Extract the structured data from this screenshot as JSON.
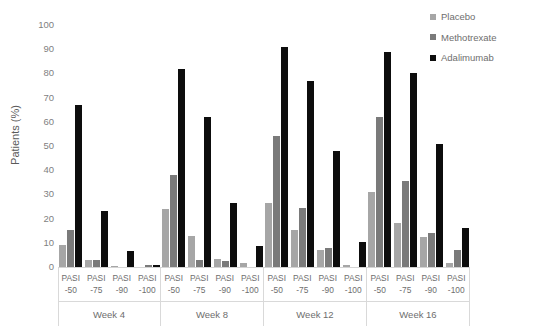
{
  "chart_data": {
    "type": "bar",
    "title": "",
    "xlabel": "",
    "ylabel": "Patients (%)",
    "ylim": [
      0,
      100
    ],
    "ytick_step": 10,
    "yticks": [
      100,
      90,
      80,
      70,
      60,
      50,
      40,
      30,
      20,
      10,
      0
    ],
    "grid": false,
    "legend_position": "top-right",
    "groups": [
      "Week 4",
      "Week 8",
      "Week 12",
      "Week 16"
    ],
    "categories": [
      "PASI -50",
      "PASI -75",
      "PASI -90",
      "PASI -100"
    ],
    "category_lines": [
      {
        "top": "PASI",
        "bottom": "-50"
      },
      {
        "top": "PASI",
        "bottom": "-75"
      },
      {
        "top": "PASI",
        "bottom": "-90"
      },
      {
        "top": "PASI",
        "bottom": "-100"
      }
    ],
    "series": [
      {
        "name": "Placebo",
        "color": "#a6a6a6"
      },
      {
        "name": "Methotrexate",
        "color": "#7a7a7a"
      },
      {
        "name": "Adalimumab",
        "color": "#0d0d0d"
      }
    ],
    "values": {
      "Week 4": {
        "PASI -50": {
          "Placebo": 9,
          "Methotrexate": 15.5,
          "Adalimumab": 67
        },
        "PASI -75": {
          "Placebo": 3,
          "Methotrexate": 3,
          "Adalimumab": 23
        },
        "PASI -90": {
          "Placebo": 0.5,
          "Methotrexate": 0,
          "Adalimumab": 6.5
        },
        "PASI -100": {
          "Placebo": 0,
          "Methotrexate": 0.7,
          "Adalimumab": 0.7
        }
      },
      "Week 8": {
        "PASI -50": {
          "Placebo": 24,
          "Methotrexate": 38,
          "Adalimumab": 82
        },
        "PASI -75": {
          "Placebo": 13,
          "Methotrexate": 3,
          "Adalimumab": 62
        },
        "PASI -90": {
          "Placebo": 3.5,
          "Methotrexate": 2.5,
          "Adalimumab": 26.5
        },
        "PASI -100": {
          "Placebo": 1.5,
          "Methotrexate": 0,
          "Adalimumab": 8.5
        }
      },
      "Week 12": {
        "PASI -50": {
          "Placebo": 26.5,
          "Methotrexate": 54,
          "Adalimumab": 91
        },
        "PASI -75": {
          "Placebo": 15.5,
          "Methotrexate": 24.5,
          "Adalimumab": 77
        },
        "PASI -90": {
          "Placebo": 7,
          "Methotrexate": 8,
          "Adalimumab": 48
        },
        "PASI -100": {
          "Placebo": 0.7,
          "Methotrexate": 0,
          "Adalimumab": 10.5
        }
      },
      "Week 16": {
        "PASI -50": {
          "Placebo": 31,
          "Methotrexate": 62,
          "Adalimumab": 89
        },
        "PASI -75": {
          "Placebo": 18,
          "Methotrexate": 35.5,
          "Adalimumab": 80
        },
        "PASI -90": {
          "Placebo": 12.5,
          "Methotrexate": 14,
          "Adalimumab": 51
        },
        "PASI -100": {
          "Placebo": 1.5,
          "Methotrexate": 7,
          "Adalimumab": 16
        }
      }
    }
  }
}
